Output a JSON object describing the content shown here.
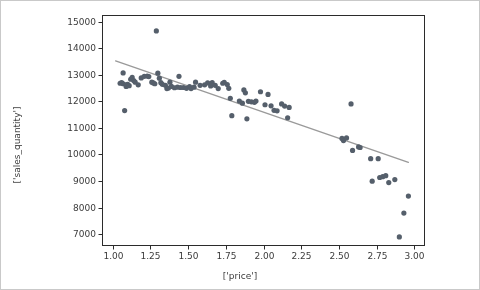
{
  "chart_data": {
    "type": "scatter",
    "title": "",
    "xlabel": "['price']",
    "ylabel": "['sales_quantity']",
    "xlim": [
      0.93,
      3.07
    ],
    "ylim": [
      6550,
      15250
    ],
    "xticks": [
      "1.00",
      "1.25",
      "1.50",
      "1.75",
      "2.00",
      "2.25",
      "2.50",
      "2.75",
      "3.00"
    ],
    "xtick_values": [
      1.0,
      1.25,
      1.5,
      1.75,
      2.0,
      2.25,
      2.5,
      2.75,
      3.0
    ],
    "yticks": [
      "7000",
      "8000",
      "9000",
      "10000",
      "11000",
      "12000",
      "13000",
      "14000",
      "15000"
    ],
    "ytick_values": [
      7000,
      8000,
      9000,
      10000,
      11000,
      12000,
      13000,
      14000,
      15000
    ],
    "grid": false,
    "legend": null,
    "marker_color": "#555f6b",
    "marker_size": 2.6,
    "line_color": "#9a9a9a",
    "line_width": 1.4,
    "axes_color": "#2b2b2b",
    "frame_color": "#c9c9c9",
    "series": [
      {
        "name": "sales_quantity vs price",
        "points": [
          [
            1.05,
            12680
          ],
          [
            1.06,
            12700
          ],
          [
            1.07,
            13070
          ],
          [
            1.07,
            12660
          ],
          [
            1.08,
            11650
          ],
          [
            1.09,
            12560
          ],
          [
            1.09,
            12620
          ],
          [
            1.1,
            12640
          ],
          [
            1.11,
            12590
          ],
          [
            1.12,
            12830
          ],
          [
            1.13,
            12900
          ],
          [
            1.14,
            12780
          ],
          [
            1.15,
            12720
          ],
          [
            1.17,
            12620
          ],
          [
            1.19,
            12880
          ],
          [
            1.21,
            12940
          ],
          [
            1.23,
            12950
          ],
          [
            1.24,
            12930
          ],
          [
            1.26,
            12720
          ],
          [
            1.27,
            12690
          ],
          [
            1.28,
            12660
          ],
          [
            1.29,
            14650
          ],
          [
            1.3,
            13060
          ],
          [
            1.31,
            12870
          ],
          [
            1.32,
            12700
          ],
          [
            1.33,
            12640
          ],
          [
            1.35,
            12600
          ],
          [
            1.36,
            12480
          ],
          [
            1.37,
            12500
          ],
          [
            1.38,
            12720
          ],
          [
            1.39,
            12560
          ],
          [
            1.41,
            12510
          ],
          [
            1.43,
            12530
          ],
          [
            1.44,
            12940
          ],
          [
            1.45,
            12520
          ],
          [
            1.47,
            12520
          ],
          [
            1.49,
            12490
          ],
          [
            1.51,
            12550
          ],
          [
            1.52,
            12480
          ],
          [
            1.54,
            12530
          ],
          [
            1.55,
            12720
          ],
          [
            1.58,
            12600
          ],
          [
            1.61,
            12620
          ],
          [
            1.63,
            12690
          ],
          [
            1.65,
            12580
          ],
          [
            1.66,
            12700
          ],
          [
            1.68,
            12600
          ],
          [
            1.7,
            12480
          ],
          [
            1.73,
            12680
          ],
          [
            1.74,
            12710
          ],
          [
            1.76,
            12630
          ],
          [
            1.77,
            12490
          ],
          [
            1.78,
            12110
          ],
          [
            1.79,
            11460
          ],
          [
            1.84,
            12010
          ],
          [
            1.86,
            11930
          ],
          [
            1.87,
            12430
          ],
          [
            1.88,
            12320
          ],
          [
            1.89,
            11340
          ],
          [
            1.9,
            12000
          ],
          [
            1.92,
            11980
          ],
          [
            1.94,
            11960
          ],
          [
            1.95,
            12010
          ],
          [
            1.98,
            12360
          ],
          [
            2.01,
            11870
          ],
          [
            2.03,
            12260
          ],
          [
            2.05,
            11830
          ],
          [
            2.07,
            11660
          ],
          [
            2.09,
            11640
          ],
          [
            2.12,
            11900
          ],
          [
            2.14,
            11820
          ],
          [
            2.16,
            11380
          ],
          [
            2.17,
            11770
          ],
          [
            2.52,
            10600
          ],
          [
            2.53,
            10520
          ],
          [
            2.55,
            10620
          ],
          [
            2.58,
            11900
          ],
          [
            2.59,
            10150
          ],
          [
            2.63,
            10280
          ],
          [
            2.64,
            10260
          ],
          [
            2.71,
            9840
          ],
          [
            2.72,
            8990
          ],
          [
            2.76,
            9840
          ],
          [
            2.77,
            9130
          ],
          [
            2.79,
            9160
          ],
          [
            2.81,
            9200
          ],
          [
            2.83,
            8940
          ],
          [
            2.87,
            9050
          ],
          [
            2.9,
            6890
          ],
          [
            2.93,
            7790
          ],
          [
            2.96,
            8430
          ]
        ]
      }
    ],
    "trendline": {
      "name": "fit",
      "x0": 1.02,
      "y0": 13520,
      "x1": 2.96,
      "y1": 9700
    }
  }
}
